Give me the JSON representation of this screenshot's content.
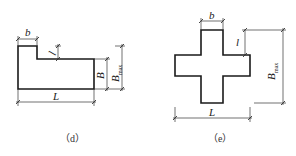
{
  "figures": [
    {
      "id": "d",
      "caption": "（d）",
      "shape": "L-shaped plan (stepped rectangle)",
      "labels": {
        "b": "b",
        "l": "l",
        "B": "B",
        "Bmax_main": "B",
        "Bmax_sub": "max",
        "L": "L"
      }
    },
    {
      "id": "e",
      "caption": "（e）",
      "shape": "cross-shaped plan",
      "labels": {
        "b": "b",
        "l": "l",
        "Bmax_main": "B",
        "Bmax_sub": "max",
        "L": "L"
      }
    }
  ],
  "colors": {
    "line": "#1a1a1a",
    "background": "#ffffff"
  }
}
